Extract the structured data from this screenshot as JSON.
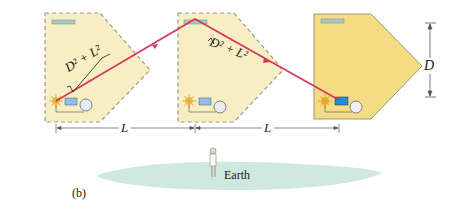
{
  "figure": {
    "panel_label": "(b)",
    "earth_label": "Earth",
    "distance_label_L": "L",
    "height_label_D": "D",
    "path_label": "√(D² + L²)",
    "path_label_left_text": "D² + L²",
    "path_label_right_text": "D² + L²"
  },
  "colors": {
    "craft_fill": "#f7eec3",
    "craft_fill_solid": "#f5dc84",
    "craft_border_dashed": "#9a9a90",
    "light_path": "#d8345a",
    "earth": "#cfe8e0",
    "dimension_line": "#555555"
  },
  "spacecraft": [
    {
      "position": "left",
      "style": "dashed"
    },
    {
      "position": "middle",
      "style": "dashed"
    },
    {
      "position": "right",
      "style": "solid"
    }
  ]
}
